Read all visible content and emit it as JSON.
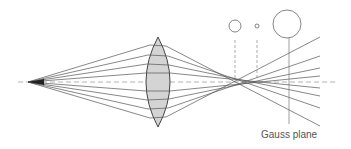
{
  "diagram": {
    "label_gauss_plane": "Gauss plane",
    "colors": {
      "ray": "#555555",
      "axis": "#999999",
      "lens_fill": "#d4d4d4",
      "lens_stroke": "#444444",
      "circle": "#666666"
    },
    "source_point": {
      "x": 28,
      "y": 82
    },
    "lens": {
      "cx": 158,
      "top": 37,
      "bottom": 127,
      "half_width": 12
    },
    "ray_heights_at_lens": [
      45,
      55,
      64,
      73,
      91,
      100,
      109,
      118
    ],
    "blur_circles": [
      {
        "name": "marginal-focus-circle",
        "cx": 235,
        "cy": 26,
        "r": 6
      },
      {
        "name": "circle-of-least-confusion",
        "cx": 257,
        "cy": 26,
        "r": 2
      },
      {
        "name": "gauss-plane-circle",
        "cx": 287,
        "cy": 24,
        "r": 14
      }
    ]
  }
}
